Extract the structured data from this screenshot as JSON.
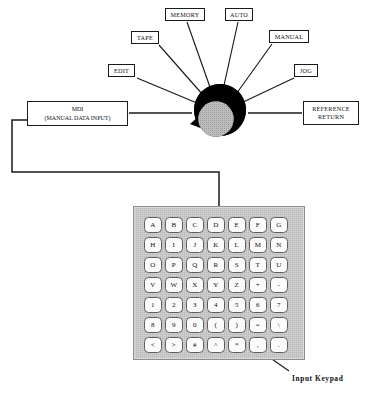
{
  "diagram": {
    "colors": {
      "line": "#1a1a1a",
      "dial_outer": "#000000",
      "dial_inner": "#b8b8b8",
      "panel_face": "#d2d2d2",
      "key_face": "#fbfbfb",
      "key_border": "#5e5e5e",
      "background": "#ffffff"
    }
  },
  "selector": {
    "name": "mode-selector-dial",
    "modes": [
      {
        "id": "edit",
        "label": "EDIT",
        "box": {
          "x": 108,
          "y": 65,
          "w": 27,
          "h": 13
        },
        "spoke": {
          "x1": 136,
          "y1": 78,
          "x2": 196,
          "y2": 104
        }
      },
      {
        "id": "tape",
        "label": "TAPE",
        "box": {
          "x": 131,
          "y": 31,
          "w": 28,
          "h": 13
        },
        "spoke": {
          "x1": 159,
          "y1": 44,
          "x2": 202,
          "y2": 96
        }
      },
      {
        "id": "memory",
        "label": "MEMORY",
        "box": {
          "x": 165,
          "y": 8,
          "w": 40,
          "h": 13
        },
        "spoke": {
          "x1": 187,
          "y1": 21,
          "x2": 211,
          "y2": 92
        }
      },
      {
        "id": "auto",
        "label": "AUTO",
        "box": {
          "x": 225,
          "y": 8,
          "w": 28,
          "h": 13
        },
        "spoke": {
          "x1": 238,
          "y1": 21,
          "x2": 222,
          "y2": 92
        }
      },
      {
        "id": "manual",
        "label": "MANUAL",
        "box": {
          "x": 269,
          "y": 30,
          "w": 40,
          "h": 13
        },
        "spoke": {
          "x1": 272,
          "y1": 43,
          "x2": 232,
          "y2": 97
        }
      },
      {
        "id": "jog",
        "label": "JOG",
        "box": {
          "x": 294,
          "y": 65,
          "w": 24,
          "h": 13
        },
        "spoke": {
          "x1": 295,
          "y1": 78,
          "x2": 237,
          "y2": 105
        }
      }
    ],
    "side_terminals": [
      {
        "id": "reference-return",
        "label": "REFERENCE\nRETURN",
        "line1": "REFERENCE",
        "line2": "RETURN",
        "box": {
          "x": 303,
          "y": 101,
          "w": 56,
          "h": 24
        },
        "spoke": {
          "x1": 303,
          "y1": 113,
          "x2": 248,
          "y2": 113
        }
      },
      {
        "id": "mdi",
        "line1": "MDI",
        "line2": "(MANUAL DATA INPUT)",
        "box": {
          "x": 27,
          "y": 101,
          "w": 101,
          "h": 25
        },
        "spoke": {
          "x1": 128,
          "y1": 113,
          "x2": 190,
          "y2": 113
        }
      }
    ],
    "dial": {
      "outer_cx": 220,
      "outer_cy": 110,
      "outer_r": 26,
      "inner_cx": 215,
      "inner_cy": 118,
      "inner_r": 18,
      "pointer_tip_x": 191,
      "pointer_tip_y": 124
    }
  },
  "keypad": {
    "name": "input-keypad",
    "caption": "Input Keypad",
    "panel": {
      "x": 133,
      "y": 206,
      "w": 172,
      "h": 154
    },
    "rows": [
      [
        "A",
        "B",
        "C",
        "D",
        "E",
        "F",
        "G"
      ],
      [
        "H",
        "I",
        "J",
        "K",
        "L",
        "M",
        "N"
      ],
      [
        "O",
        "P",
        "Q",
        "R",
        "S",
        "T",
        "U"
      ],
      [
        "V",
        "W",
        "X",
        "Y",
        "Z",
        "+",
        "-"
      ],
      [
        "1",
        "2",
        "3",
        "4",
        "5",
        "6",
        "7"
      ],
      [
        "8",
        "9",
        "0",
        "(",
        ")",
        "=",
        "\\"
      ],
      [
        "<",
        ">",
        "#",
        "^",
        "*",
        ",",
        "."
      ]
    ],
    "arrow": {
      "x1": 290,
      "y1": 372,
      "x2": 257,
      "y2": 349
    }
  },
  "connector": {
    "name": "mdi-to-keypad-connector",
    "points": "27,120 12,120 12,172 219,172 219,206"
  }
}
